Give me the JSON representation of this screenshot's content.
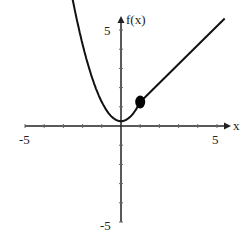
{
  "chart_data": {
    "type": "line",
    "title": "",
    "xlabel": "x",
    "ylabel": "f(x)",
    "xlim": [
      -5,
      5
    ],
    "ylim": [
      -5,
      5
    ],
    "x_tick_labels": [
      "-5",
      "5"
    ],
    "y_tick_labels": [
      "5",
      "-5"
    ],
    "grid": false,
    "note": "Piecewise function; coordinates estimated visually from pixel positions",
    "series": [
      {
        "name": "left piece (parabola, approx.)",
        "points": [
          [
            -2.9,
            5.8
          ],
          [
            -2,
            4.25
          ],
          [
            -1,
            1.25
          ],
          [
            0,
            0.25
          ],
          [
            0.5,
            0.5
          ],
          [
            1,
            1.25
          ]
        ]
      },
      {
        "name": "right piece (line, approx.)",
        "points": [
          [
            1,
            1.25
          ],
          [
            5.4,
            5.6
          ]
        ]
      }
    ],
    "annotations": [
      {
        "type": "filled-point",
        "x": 1,
        "y": 1.25
      }
    ]
  },
  "labels": {
    "x_axis": "x",
    "y_axis": "f(x)",
    "x_min": "-5",
    "x_max": "5",
    "y_max": "5",
    "y_min": "-5"
  }
}
